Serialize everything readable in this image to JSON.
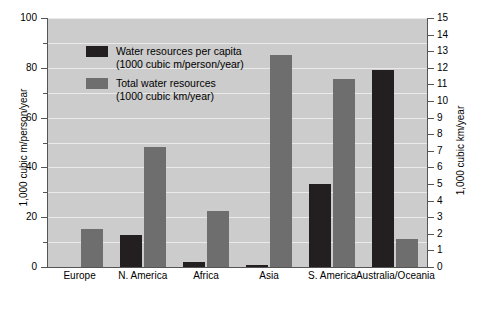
{
  "chart_data": {
    "type": "bar",
    "title": "",
    "categories": [
      "Europe",
      "N. America",
      "Africa",
      "Asia",
      "S. America",
      "Australia/Oceania"
    ],
    "series": [
      {
        "name": "Water resources per capita",
        "units": "(1000 cubic m/person/year)",
        "color": "#231f20",
        "axis": "left",
        "values": [
          0,
          13,
          2,
          1,
          33.5,
          79
        ]
      },
      {
        "name": "Total water resources",
        "units": "(1000 cubic km/year)",
        "color": "#6e6e6e",
        "axis": "right",
        "values": [
          2.3,
          7.2,
          3.4,
          12.8,
          11.3,
          1.7
        ]
      }
    ],
    "xlabel": "",
    "ylabel_left": "1,000 cubic m/person/year",
    "ylabel_right": "1,000 cubic km/year",
    "ylim_left": [
      0,
      100
    ],
    "ylim_right": [
      0,
      15
    ],
    "yticks_left": [
      0,
      20,
      40,
      60,
      80,
      100
    ],
    "yticks_left_minor": [
      10,
      30,
      50,
      70,
      90
    ],
    "yticks_right": [
      0,
      1,
      2,
      3,
      4,
      5,
      6,
      7,
      8,
      9,
      10,
      11,
      12,
      13,
      14,
      15
    ],
    "grid": true,
    "legend_position": "top-left",
    "plot_background": "#cccccc",
    "gridline_color": "#eaeaea"
  },
  "legend": {
    "items": [
      {
        "label": "Water resources per capita",
        "sublabel": "(1000 cubic m/person/year)",
        "swatch": "black"
      },
      {
        "label": "Total water resources",
        "sublabel": "(1000 cubic km/year)",
        "swatch": "gray"
      }
    ]
  },
  "axes": {
    "left": {
      "title": "1,000 cubic m/person/year",
      "labels": [
        "100",
        "80",
        "60",
        "40",
        "20",
        "0"
      ]
    },
    "right": {
      "title": "1,000 cubic km/year",
      "labels": [
        "15",
        "14",
        "13",
        "12",
        "11",
        "10",
        "9",
        "8",
        "7",
        "6",
        "5",
        "4",
        "3",
        "2",
        "1",
        "0"
      ]
    }
  }
}
